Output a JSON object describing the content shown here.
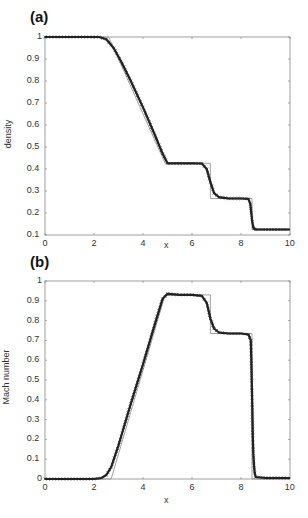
{
  "chart_data": [
    {
      "type": "line",
      "panel_label": "(a)",
      "title": "",
      "xlabel": "x",
      "ylabel": "density",
      "xlim": [
        0,
        10
      ],
      "ylim": [
        0.1,
        1
      ],
      "xticks": [
        0,
        2,
        4,
        6,
        8,
        10
      ],
      "yticks": [
        0.1,
        0.2,
        0.3,
        0.4,
        0.5,
        0.6,
        0.7,
        0.8,
        0.9,
        1
      ],
      "ytick_labels": [
        "0.1",
        "0.2",
        "0.3",
        "0.4",
        "0.5",
        "0.6",
        "0.7",
        "0.8",
        "0.9",
        "1"
      ],
      "grid": false,
      "legend": null,
      "series": [
        {
          "name": "exact",
          "style": "thin-line",
          "x": [
            0,
            2.6,
            4.9,
            6.75,
            6.75,
            8.45,
            8.45,
            10
          ],
          "y": [
            1.0,
            1.0,
            0.426,
            0.426,
            0.266,
            0.266,
            0.125,
            0.125
          ]
        },
        {
          "name": "numerical",
          "style": "markers-x",
          "x": [
            0,
            2.2,
            2.5,
            2.8,
            3.1,
            3.5,
            4.0,
            4.5,
            4.8,
            5.0,
            5.5,
            6.0,
            6.4,
            6.6,
            6.75,
            6.9,
            7.1,
            7.5,
            8.0,
            8.3,
            8.38,
            8.42,
            8.46,
            8.5,
            8.55,
            8.6,
            9.0,
            9.5,
            10
          ],
          "y": [
            1.0,
            1.0,
            0.99,
            0.95,
            0.89,
            0.8,
            0.68,
            0.55,
            0.47,
            0.426,
            0.426,
            0.426,
            0.425,
            0.4,
            0.34,
            0.29,
            0.272,
            0.266,
            0.266,
            0.264,
            0.24,
            0.2,
            0.16,
            0.135,
            0.128,
            0.125,
            0.125,
            0.125,
            0.125
          ]
        }
      ]
    },
    {
      "type": "line",
      "panel_label": "(b)",
      "title": "",
      "xlabel": "x",
      "ylabel": "Mach number",
      "xlim": [
        0,
        10
      ],
      "ylim": [
        0,
        1
      ],
      "xticks": [
        0,
        2,
        4,
        6,
        8,
        10
      ],
      "yticks": [
        0,
        0.1,
        0.2,
        0.3,
        0.4,
        0.5,
        0.6,
        0.7,
        0.8,
        0.9,
        1
      ],
      "ytick_labels": [
        "0",
        "0.1",
        "0.2",
        "0.3",
        "0.4",
        "0.5",
        "0.6",
        "0.7",
        "0.8",
        "0.9",
        "1"
      ],
      "grid": false,
      "legend": null,
      "series": [
        {
          "name": "exact",
          "style": "thin-line",
          "x": [
            0,
            2.7,
            4.9,
            6.75,
            6.75,
            8.45,
            8.45,
            10
          ],
          "y": [
            0,
            0,
            0.93,
            0.93,
            0.735,
            0.735,
            0,
            0
          ]
        },
        {
          "name": "numerical",
          "style": "markers-x",
          "x": [
            0,
            2.0,
            2.3,
            2.5,
            2.7,
            3.0,
            3.5,
            4.0,
            4.5,
            4.8,
            5.0,
            5.5,
            6.0,
            6.4,
            6.6,
            6.75,
            6.9,
            7.1,
            7.5,
            8.0,
            8.3,
            8.4,
            8.42,
            8.44,
            8.46,
            8.48,
            8.5,
            8.53,
            8.56,
            8.6,
            9.0,
            9.5,
            10
          ],
          "y": [
            0,
            0,
            0.005,
            0.02,
            0.06,
            0.17,
            0.38,
            0.58,
            0.79,
            0.91,
            0.935,
            0.93,
            0.93,
            0.925,
            0.89,
            0.81,
            0.76,
            0.74,
            0.735,
            0.735,
            0.73,
            0.7,
            0.6,
            0.48,
            0.36,
            0.22,
            0.13,
            0.07,
            0.03,
            0.01,
            0.005,
            0.005,
            0.005
          ]
        }
      ]
    }
  ],
  "panels": {
    "a": {
      "label": "(a)",
      "ylabel": "density",
      "xlabel": "x",
      "xtick_labels": [
        "0",
        "2",
        "4",
        "6",
        "8",
        "10"
      ],
      "ytick_labels": [
        "0.1",
        "0.2",
        "0.3",
        "0.4",
        "0.5",
        "0.6",
        "0.7",
        "0.8",
        "0.9",
        "1"
      ]
    },
    "b": {
      "label": "(b)",
      "ylabel": "Mach number",
      "xlabel": "x",
      "xtick_labels": [
        "0",
        "2",
        "4",
        "6",
        "8",
        "10"
      ],
      "ytick_labels": [
        "0",
        "0.1",
        "0.2",
        "0.3",
        "0.4",
        "0.5",
        "0.6",
        "0.7",
        "0.8",
        "0.9",
        "1"
      ]
    }
  },
  "colors": {
    "axes": "#888888",
    "exact_line": "#999999",
    "numerical": "#222222",
    "text": "#333333"
  }
}
